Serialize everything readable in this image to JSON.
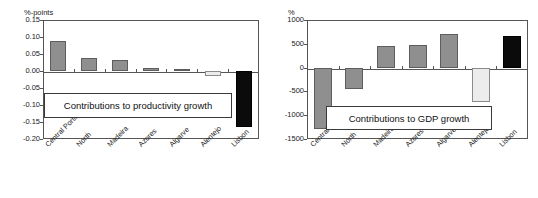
{
  "figure": {
    "background_color": "#ffffff",
    "panel_count": 2
  },
  "colors": {
    "bar_gray": "#8f8f8f",
    "bar_light": "#ececec",
    "bar_black": "#0b0b0b",
    "axis": "#555555",
    "text": "#1a1a1a"
  },
  "chart_data": [
    {
      "type": "bar",
      "title": "",
      "annotation": "Contributions to productivity growth",
      "xlabel": "",
      "ylabel": "%-points",
      "ylim": [
        -0.2,
        0.15
      ],
      "yticks": [
        "0.15",
        "0.10",
        "0.05",
        "0.00",
        "-0.05",
        "-0.10",
        "-0.15",
        "-0.20"
      ],
      "ytick_values": [
        0.15,
        0.1,
        0.05,
        0.0,
        -0.05,
        -0.1,
        -0.15,
        -0.2
      ],
      "grid": false,
      "legend": "none",
      "categories": [
        "Central Portugal",
        "North",
        "Madeira",
        "Azores",
        "Algarve",
        "Alentejo",
        "Lisbon"
      ],
      "values": [
        0.088,
        0.038,
        0.031,
        0.008,
        0.007,
        -0.015,
        -0.166
      ],
      "bar_styles": [
        "gray",
        "gray",
        "gray",
        "gray",
        "gray",
        "light",
        "black"
      ]
    },
    {
      "type": "bar",
      "title": "",
      "annotation": "Contributions to GDP growth",
      "xlabel": "",
      "ylabel": "%",
      "ylim": [
        -1500,
        1000
      ],
      "yticks": [
        "1000",
        "500",
        "0",
        "-500",
        "-1000",
        "-1500"
      ],
      "ytick_values": [
        1000,
        500,
        0,
        -500,
        -1000,
        -1500
      ],
      "grid": false,
      "legend": "none",
      "categories": [
        "Central Portugal",
        "North",
        "Madeira",
        "Azores",
        "Algarve",
        "Alentejo",
        "Lisbon"
      ],
      "values": [
        -1280,
        -450,
        455,
        480,
        700,
        -730,
        660
      ],
      "bar_styles": [
        "gray",
        "gray",
        "gray",
        "gray",
        "gray",
        "light",
        "black"
      ]
    }
  ]
}
